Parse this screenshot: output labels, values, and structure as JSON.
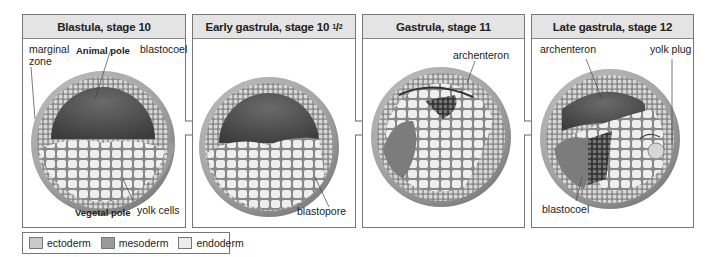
{
  "panels": [
    {
      "title_main": "Blastula, stage 10",
      "title_sup": "",
      "title_sub": "",
      "labels": {
        "marginal_zone_1": "marginal",
        "marginal_zone_2": "zone",
        "animal_pole": "Animal pole",
        "blastocoel": "blastocoel",
        "yolk_cells": "yolk cells",
        "vegetal_pole": "Vegetal pole"
      }
    },
    {
      "title_main": "Early gastrula, stage 10",
      "title_sup": "1",
      "title_sub": "2",
      "labels": {
        "blastopore": "blastopore"
      }
    },
    {
      "title_main": "Gastrula, stage 11",
      "title_sup": "",
      "title_sub": "",
      "labels": {
        "archenteron": "archenteron"
      }
    },
    {
      "title_main": "Late gastrula, stage 12",
      "title_sup": "",
      "title_sub": "",
      "labels": {
        "archenteron": "archenteron",
        "yolk_plug": "yolk plug",
        "blastocoel": "blastocoel"
      }
    }
  ],
  "legend": [
    {
      "label": "ectoderm",
      "color": "#c9c9c9"
    },
    {
      "label": "mesoderm",
      "color": "#9a9a9a"
    },
    {
      "label": "endoderm",
      "color": "#ececec"
    }
  ],
  "colors": {
    "header_bg": "#e4e4e4",
    "border": "#777777",
    "embryo_shell": "#a8a8a8",
    "cavity": "#555555",
    "cells": "#eeeeee"
  }
}
